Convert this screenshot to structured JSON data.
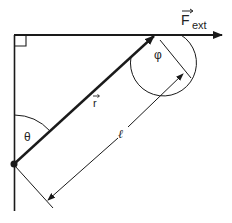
{
  "diagram": {
    "type": "torque-lever-arm",
    "labels": {
      "force": "F",
      "force_subscript": "ext",
      "position_vector": "r",
      "theta": "θ",
      "phi": "φ",
      "lever_arm": "ℓ"
    },
    "colors": {
      "line": "#1a1a1a",
      "label": "#222222",
      "background": "#ffffff"
    }
  }
}
